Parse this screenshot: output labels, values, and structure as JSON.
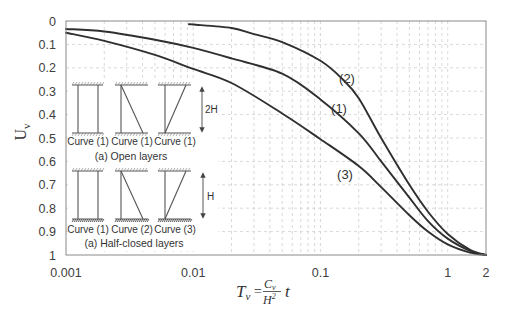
{
  "chart_data": {
    "type": "line",
    "title": "",
    "xlabel": "T_v = (C_v / H^2) t",
    "ylabel": "U_v",
    "xscale": "log",
    "xlim": [
      0.001,
      2
    ],
    "ylim": [
      0,
      1
    ],
    "y_inverted": true,
    "grid": true,
    "legend": "none (curves labeled inline)",
    "x_ticks": [
      {
        "value": 0.001,
        "label": "0.001"
      },
      {
        "value": 0.01,
        "label": "0.01"
      },
      {
        "value": 0.1,
        "label": "0.1"
      },
      {
        "value": 1,
        "label": "1"
      },
      {
        "value": 2,
        "label": "2"
      }
    ],
    "y_ticks": [
      {
        "value": 0,
        "label": "0"
      },
      {
        "value": 0.1,
        "label": "0.1"
      },
      {
        "value": 0.2,
        "label": "0.2"
      },
      {
        "value": 0.3,
        "label": "0.3"
      },
      {
        "value": 0.4,
        "label": "0.4"
      },
      {
        "value": 0.5,
        "label": "0.5"
      },
      {
        "value": 0.6,
        "label": "0.6"
      },
      {
        "value": 0.7,
        "label": "0.7"
      },
      {
        "value": 0.8,
        "label": "0.8"
      },
      {
        "value": 0.9,
        "label": "0.9"
      },
      {
        "value": 1,
        "label": "1"
      }
    ],
    "series": [
      {
        "name": "(1)",
        "x": [
          0.001,
          0.002,
          0.005,
          0.01,
          0.02,
          0.05,
          0.1,
          0.2,
          0.3,
          0.5,
          0.7,
          1,
          1.5,
          2
        ],
        "y": [
          0.034,
          0.045,
          0.08,
          0.115,
          0.16,
          0.225,
          0.335,
          0.48,
          0.6,
          0.755,
          0.855,
          0.93,
          0.982,
          1.0
        ]
      },
      {
        "name": "(2)",
        "x": [
          0.0093,
          0.01,
          0.02,
          0.03,
          0.05,
          0.1,
          0.15,
          0.2,
          0.3,
          0.5,
          0.7,
          1,
          1.5,
          2
        ],
        "y": [
          0.014,
          0.015,
          0.03,
          0.056,
          0.09,
          0.17,
          0.25,
          0.33,
          0.5,
          0.7,
          0.815,
          0.91,
          0.978,
          1.0
        ]
      },
      {
        "name": "(3)",
        "x": [
          0.001,
          0.002,
          0.005,
          0.01,
          0.02,
          0.05,
          0.1,
          0.2,
          0.3,
          0.5,
          0.7,
          1,
          1.5,
          2
        ],
        "y": [
          0.05,
          0.085,
          0.145,
          0.205,
          0.265,
          0.395,
          0.505,
          0.62,
          0.71,
          0.83,
          0.9,
          0.955,
          0.99,
          1.0
        ]
      }
    ],
    "annotations": [
      {
        "text": "(2)",
        "x_px": 347,
        "y_px": 78
      },
      {
        "text": "(1)",
        "x_px": 339,
        "y_px": 108
      },
      {
        "text": "(3)",
        "x_px": 345,
        "y_px": 174
      }
    ]
  },
  "axis": {
    "ylabel_main": "U",
    "ylabel_sub": "v",
    "formula": {
      "lhs": "T",
      "lhs_sub": "v",
      "equals": "=",
      "num": "C",
      "num_sub": "v",
      "den": "H",
      "den_sup": "2",
      "tail": "t"
    }
  },
  "inset": {
    "open_layers": {
      "caption": "(a) Open layers",
      "thickness_label": "2H",
      "labels": [
        "Curve (1)",
        "Curve (1)",
        "Curve (1)"
      ]
    },
    "half_closed_layers": {
      "caption": "(a) Half-closed layers",
      "thickness_label": "H",
      "labels": [
        "Curve (1)",
        "Curve (2)",
        "Curve (3)"
      ]
    }
  },
  "colors": {
    "curve": "#2f2f2f",
    "grid": "#cfcfcf",
    "frame": "#8a8a8a",
    "text": "#404040"
  }
}
